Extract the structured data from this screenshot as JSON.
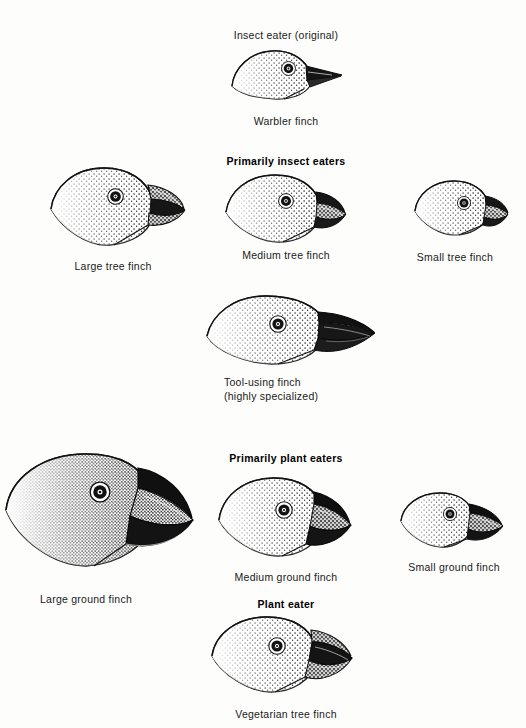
{
  "figure": {
    "background_color": "#fdfdfc",
    "ink_color": "#1a1a1a"
  },
  "group_headings": [
    {
      "id": "insect-eater-original",
      "label": "Insect eater (original)",
      "x": 286,
      "y": 28
    },
    {
      "id": "primarily-insect-eaters",
      "label": "Primarily insect eaters",
      "x": 286,
      "y": 155
    },
    {
      "id": "primarily-plant-eaters",
      "label": "Primarily plant eaters",
      "x": 286,
      "y": 452
    },
    {
      "id": "plant-eater",
      "label": "Plant eater",
      "x": 286,
      "y": 598
    }
  ],
  "finches": [
    {
      "id": "warbler-finch",
      "caption": "Warbler finch",
      "caption_x": 286,
      "caption_y": 114,
      "caption_align": "center",
      "head_x": 228,
      "head_y": 42,
      "scale": 0.62,
      "beak": "thin-pointed",
      "diet": "insects"
    },
    {
      "id": "large-tree-finch",
      "caption": "Large tree finch",
      "caption_x": 113,
      "caption_y": 259,
      "caption_align": "center",
      "head_x": 48,
      "head_y": 163,
      "scale": 0.95,
      "beak": "large-curved-parrotlike",
      "diet": "insects"
    },
    {
      "id": "medium-tree-finch",
      "caption": "Medium tree finch",
      "caption_x": 286,
      "caption_y": 248,
      "caption_align": "center",
      "head_x": 223,
      "head_y": 170,
      "scale": 0.85,
      "beak": "medium-stout",
      "diet": "insects"
    },
    {
      "id": "small-tree-finch",
      "caption": "Small tree finch",
      "caption_x": 455,
      "caption_y": 250,
      "caption_align": "center",
      "head_x": 412,
      "head_y": 177,
      "scale": 0.66,
      "beak": "small-stout",
      "diet": "insects"
    },
    {
      "id": "tool-using-finch",
      "caption": "Tool-using finch",
      "caption2": "(highly specialized)",
      "caption_x": 224,
      "caption_y": 375,
      "caption_align": "left",
      "head_x": 204,
      "head_y": 292,
      "scale": 1.12,
      "beak": "long-straight-probing",
      "diet": "insects-tool-user"
    },
    {
      "id": "large-ground-finch",
      "caption": "Large ground finch",
      "caption_x": 86,
      "caption_y": 592,
      "caption_align": "center",
      "head_x": 2,
      "head_y": 448,
      "scale": 1.45,
      "beak": "massive-crushing",
      "diet": "seeds"
    },
    {
      "id": "medium-ground-finch",
      "caption": "Medium ground finch",
      "caption_x": 286,
      "caption_y": 570,
      "caption_align": "center",
      "head_x": 216,
      "head_y": 472,
      "scale": 0.92,
      "beak": "stout-conical",
      "diet": "seeds"
    },
    {
      "id": "small-ground-finch",
      "caption": "Small ground finch",
      "caption_x": 454,
      "caption_y": 560,
      "caption_align": "center",
      "head_x": 398,
      "head_y": 489,
      "scale": 0.64,
      "beak": "small-conical",
      "diet": "seeds"
    },
    {
      "id": "vegetarian-tree-finch",
      "caption": "Vegetarian tree finch",
      "caption_x": 286,
      "caption_y": 707,
      "caption_align": "center",
      "head_x": 209,
      "head_y": 612,
      "scale": 1.0,
      "beak": "parrot-like-blunt",
      "diet": "buds-fruit"
    }
  ]
}
